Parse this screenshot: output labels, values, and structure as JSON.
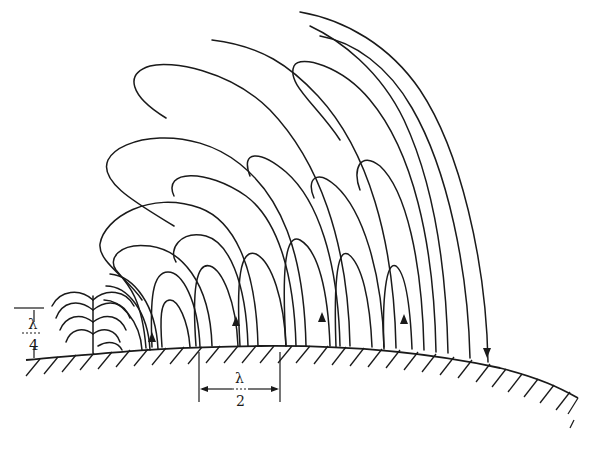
{
  "diagram": {
    "labels": {
      "quarter_wave_num": "λ",
      "quarter_wave_den": "4",
      "half_wave_num": "λ",
      "half_wave_den": "2"
    },
    "colors": {
      "ink": "#1a1a1a",
      "background": "#ffffff"
    },
    "arrows": [
      "up",
      "up",
      "up",
      "up",
      "down"
    ]
  }
}
